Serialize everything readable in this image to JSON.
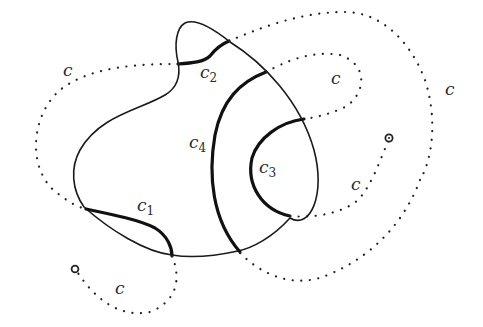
{
  "figure": {
    "labels": {
      "c_top_left": "c",
      "c_inner_right": "c",
      "c_outer_right": "c",
      "c_mid_right": "c",
      "c_bottom_left": "c",
      "c1_base": "c",
      "c1_sub": "1",
      "c2_base": "c",
      "c2_sub": "2",
      "c3_base": "c",
      "c3_sub": "3",
      "c4_base": "c",
      "c4_sub": "4"
    },
    "colors": {
      "stroke": "#111111",
      "background": "#ffffff"
    }
  }
}
